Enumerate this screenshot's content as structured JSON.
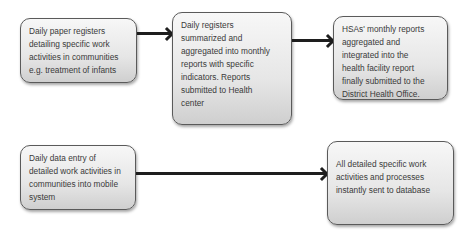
{
  "paper_flow": {
    "boxes": [
      {
        "text": "Daily paper registers\ndetailing specific work\nactivities in communities\ne.g. treatment of infants"
      },
      {
        "text": "Daily registers\nsummarized and\naggregated into monthly\nreports with specific\nindicators. Reports\nsubmitted to Health\ncenter"
      },
      {
        "text": "HSAs' monthly reports\naggregated and\nintegrated into the\nhealth facility report\nfinally submitted to the\nDistrict Health Office."
      }
    ]
  },
  "mobile_flow": {
    "boxes": [
      {
        "text": "Daily data entry of\ndetailed work activities in\ncommunities into mobile\nsystem"
      },
      {
        "text": "All detailed specific work\nactivities and processes\ninstantly sent to database"
      }
    ]
  },
  "colors": {
    "box_border": "#5a5a5a",
    "box_fill_top": "#f7f7f7",
    "box_fill_bottom": "#cfcfcf",
    "arrow": "#1e1e1e",
    "text": "#3a3a3a"
  }
}
